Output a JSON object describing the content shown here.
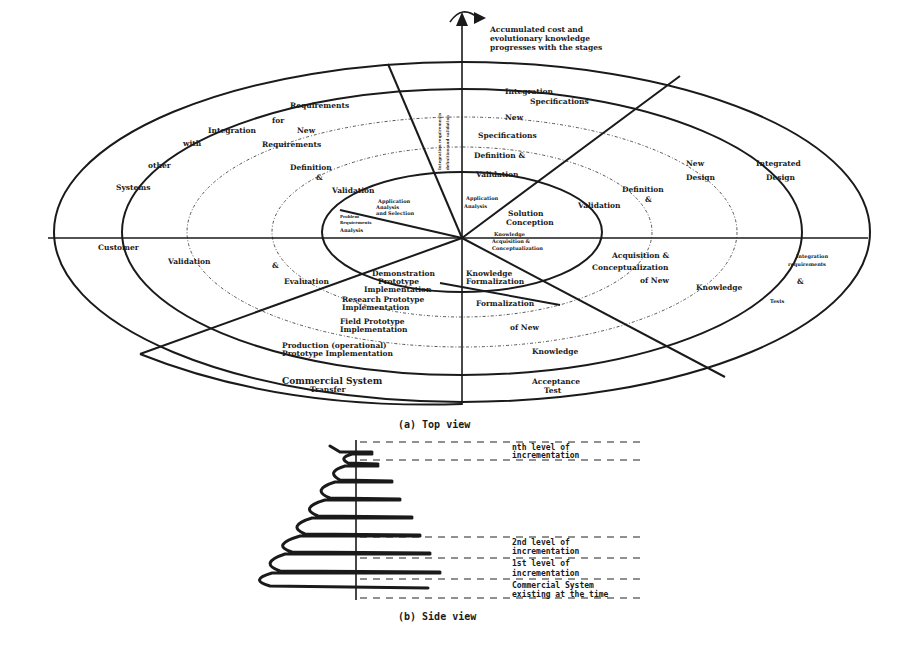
{
  "top_view": {
    "caption": "(a) Top view",
    "axis_note": [
      "Accumulated cost and",
      "evolutionary knowledge",
      "progresses with the stages"
    ],
    "labels": {
      "req_integration": [
        "Requirements",
        "for",
        "Integration",
        "with",
        "other",
        "Systems"
      ],
      "new_requirements": [
        "New",
        "Requirements"
      ],
      "def_val_left": [
        "Definition",
        "&",
        "Validation"
      ],
      "app_analysis": [
        "Application",
        "Analysis",
        "and Selection"
      ],
      "problem_req": [
        "Problem",
        "Requirements",
        "Analysis"
      ],
      "vertical_note": [
        "Integration requirements",
        "definition and validation"
      ],
      "integration_spec": [
        "Integration",
        "Specifications"
      ],
      "new_spec": [
        "New",
        "Specifications"
      ],
      "def_val_top": [
        "Definition &",
        "Validation"
      ],
      "app_analysis_right": [
        "Application",
        "Analysis"
      ],
      "solution_conception": [
        "Solution",
        "Conception"
      ],
      "new_design": [
        "New",
        "Design"
      ],
      "integrated_design": [
        "Integrated",
        "Design"
      ],
      "def_val_right": [
        "Definition",
        "&",
        "Validation"
      ],
      "knowledge_acq": [
        "Knowledge",
        "Acquisition &",
        "Conceptualization"
      ],
      "acq_conc_new_knowledge": [
        "Acquisition &",
        "Conceptualization",
        "of New",
        "Knowledge"
      ],
      "integration_req_right": [
        "Integration",
        "requirements",
        "&",
        "Tests"
      ],
      "knowledge_formalization": [
        "Knowledge",
        "Formalization"
      ],
      "formalization_new_knowledge": [
        "Formalization",
        "of New",
        "Knowledge"
      ],
      "acceptance_test": [
        "Acceptance",
        "Test"
      ],
      "customer": "Customer",
      "validation_evaluation": [
        "Validation",
        "&",
        "Evaluation"
      ],
      "demonstration_proto": [
        "Demonstration",
        "Prototype",
        "Implementation"
      ],
      "research_proto": [
        "Research Prototype",
        "Implementation"
      ],
      "field_proto": [
        "Field Prototype",
        "Implementation"
      ],
      "production_proto": [
        "Production (operational)",
        "Prototype Implementation"
      ],
      "commercial_transfer": [
        "Commercial System",
        "Transfer"
      ]
    }
  },
  "side_view": {
    "caption": "(b) Side view",
    "levels": [
      {
        "label": [
          "nth level of",
          "incrementation"
        ]
      },
      {
        "label": [
          "2nd level of",
          "incrementation"
        ]
      },
      {
        "label": [
          "1st level of",
          "incrementation"
        ]
      },
      {
        "label": [
          "Commercial System",
          "existing at the time"
        ]
      }
    ]
  }
}
